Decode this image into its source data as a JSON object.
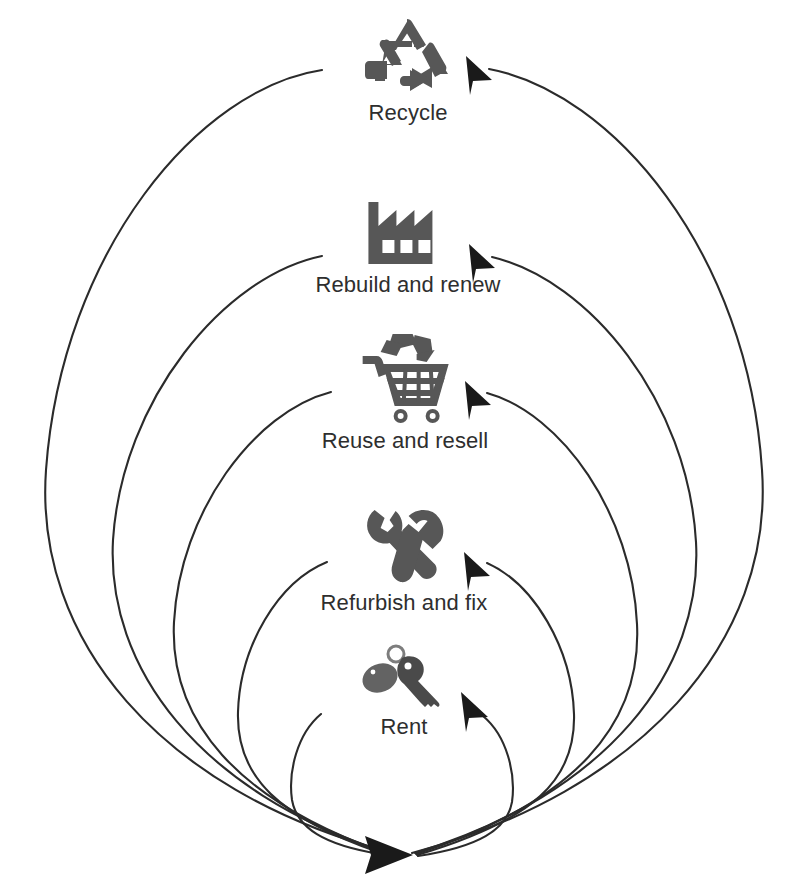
{
  "diagram": {
    "type": "nested-loop-cycle",
    "background_color": "#ffffff",
    "line_color": "#2b2b2b",
    "icon_color": "#575757",
    "label_color": "#2e2e2e",
    "hub": {
      "name": "convergence-point",
      "x": 399,
      "y": 855,
      "arrow_direction": "right"
    },
    "nodes": [
      {
        "id": "recycle",
        "label": "Recycle",
        "icon": "recycle-icon",
        "loop_index": 5,
        "icon_x": 408,
        "icon_y": 18,
        "label_y": 100,
        "loop_width": 760,
        "arrow_x": 477,
        "arrow_y": 66
      },
      {
        "id": "rebuild-and-renew",
        "label": "Rebuild and renew",
        "icon": "factory-icon",
        "loop_index": 4,
        "icon_x": 408,
        "icon_y": 198,
        "label_y": 272,
        "loop_width": 600,
        "arrow_x": 480,
        "arrow_y": 254
      },
      {
        "id": "reuse-and-resell",
        "label": "Reuse and resell",
        "icon": "shopping-cart-icon",
        "loop_index": 3,
        "icon_x": 405,
        "icon_y": 330,
        "label_y": 428,
        "loop_width": 452,
        "arrow_x": 476,
        "arrow_y": 391
      },
      {
        "id": "refurbish-and-fix",
        "label": "Refurbish and fix",
        "icon": "tools-icon",
        "loop_index": 2,
        "icon_x": 404,
        "icon_y": 506,
        "label_y": 593,
        "loop_width": 312,
        "arrow_x": 475,
        "arrow_y": 563
      },
      {
        "id": "rent",
        "label": "Rent",
        "icon": "keys-icon",
        "loop_index": 1,
        "icon_x": 404,
        "icon_y": 644,
        "label_y": 712,
        "loop_width": 172,
        "arrow_x": 474,
        "arrow_y": 706
      }
    ]
  }
}
